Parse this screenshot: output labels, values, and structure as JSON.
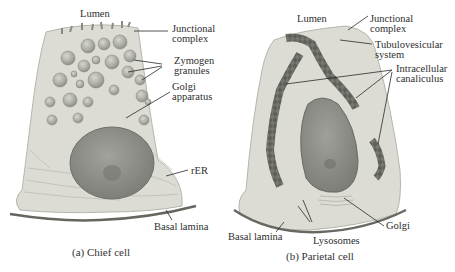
{
  "figure": {
    "panels": [
      {
        "id": "a",
        "caption": "(a) Chief cell",
        "labels": {
          "lumen": "Lumen",
          "junctional_complex_1": "Junctional",
          "junctional_complex_2": "complex",
          "zymogen_1": "Zymogen",
          "zymogen_2": "granules",
          "golgi_1": "Golgi",
          "golgi_2": "apparatus",
          "rer": "rER",
          "basal_lamina": "Basal lamina"
        }
      },
      {
        "id": "b",
        "caption": "(b) Parietal cell",
        "labels": {
          "lumen": "Lumen",
          "junctional_complex_1": "Junctional",
          "junctional_complex_2": "complex",
          "tubulovesicular_1": "Tubulovesicular",
          "tubulovesicular_2": "system",
          "canaliculus_1": "Intracellular",
          "canaliculus_2": "canaliculus",
          "golgi": "Golgi",
          "lysosomes": "Lysosomes",
          "basal_lamina": "Basal lamina"
        }
      }
    ],
    "colors": {
      "cytoplasm": "#dcdcd4",
      "granule": "#b4b4ac",
      "nucleus": "#8e8e88",
      "canaliculus": "#5c5c58",
      "line": "#2a2a2a"
    }
  }
}
